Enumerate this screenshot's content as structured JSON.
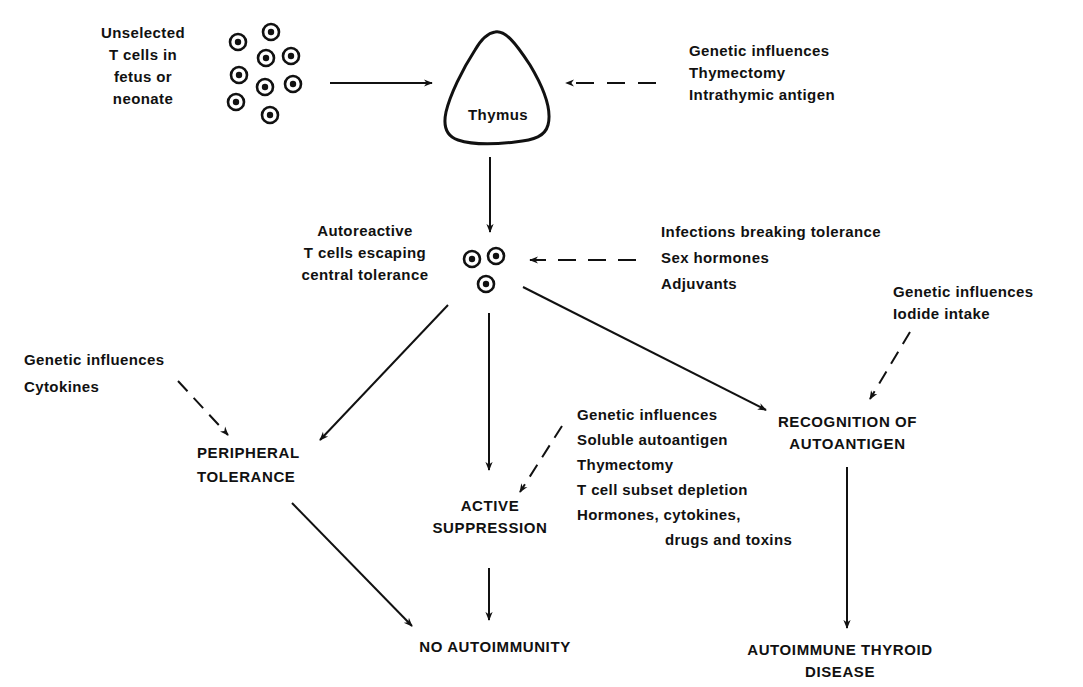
{
  "diagram": {
    "nodes": {
      "unselected_t_cells": {
        "lines": [
          "Unselected",
          "T cells in",
          "fetus or",
          "neonate"
        ]
      },
      "thymus": {
        "label": "Thymus"
      },
      "thymus_influences": {
        "lines": [
          "Genetic influences",
          "Thymectomy",
          "Intrathymic antigen"
        ]
      },
      "autoreactive_t_cells": {
        "lines": [
          "Autoreactive",
          "T cells escaping",
          "central tolerance"
        ]
      },
      "tolerance_breakers": {
        "lines": [
          "Infections breaking tolerance",
          "Sex hormones",
          "Adjuvants"
        ]
      },
      "recognition_influences": {
        "lines": [
          "Genetic influences",
          "Iodide  intake"
        ]
      },
      "peripheral_influences": {
        "lines": [
          "Genetic influences",
          "Cytokines"
        ]
      },
      "peripheral_tolerance": {
        "lines": [
          "PERIPHERAL",
          "TOLERANCE"
        ]
      },
      "active_suppression": {
        "lines": [
          "ACTIVE",
          "SUPPRESSION"
        ]
      },
      "suppression_influences": {
        "lines": [
          "Genetic influences",
          "Soluble autoantigen",
          "Thymectomy",
          "T cell subset depletion",
          "Hormones, cytokines,",
          "drugs and toxins"
        ]
      },
      "recognition_of_autoantigen": {
        "lines": [
          "RECOGNITION OF",
          "AUTOANTIGEN"
        ]
      },
      "no_autoimmunity": {
        "label": "NO AUTOIMMUNITY"
      },
      "autoimmune_thyroid_disease": {
        "lines": [
          "AUTOIMMUNE THYROID",
          "DISEASE"
        ]
      }
    },
    "edges": [
      {
        "from": "unselected_t_cells",
        "to": "thymus",
        "style": "solid"
      },
      {
        "from": "thymus_influences",
        "to": "thymus",
        "style": "dashed"
      },
      {
        "from": "thymus",
        "to": "autoreactive_t_cells",
        "style": "solid"
      },
      {
        "from": "tolerance_breakers",
        "to": "autoreactive_t_cells",
        "style": "dashed"
      },
      {
        "from": "autoreactive_t_cells",
        "to": "peripheral_tolerance",
        "style": "solid"
      },
      {
        "from": "autoreactive_t_cells",
        "to": "active_suppression",
        "style": "solid"
      },
      {
        "from": "autoreactive_t_cells",
        "to": "recognition_of_autoantigen",
        "style": "solid"
      },
      {
        "from": "peripheral_influences",
        "to": "peripheral_tolerance",
        "style": "dashed"
      },
      {
        "from": "suppression_influences",
        "to": "active_suppression",
        "style": "dashed"
      },
      {
        "from": "recognition_influences",
        "to": "recognition_of_autoantigen",
        "style": "dashed"
      },
      {
        "from": "peripheral_tolerance",
        "to": "no_autoimmunity",
        "style": "solid"
      },
      {
        "from": "active_suppression",
        "to": "no_autoimmunity",
        "style": "solid"
      },
      {
        "from": "recognition_of_autoantigen",
        "to": "autoimmune_thyroid_disease",
        "style": "solid"
      }
    ],
    "colors": {
      "ink": "#111111",
      "background": "#ffffff"
    }
  }
}
